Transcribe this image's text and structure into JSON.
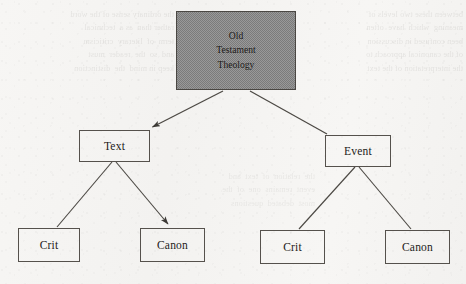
{
  "diagram": {
    "type": "tree",
    "title": "Old Testament Theology",
    "root": {
      "id": "root",
      "lines": [
        "Old",
        "Testament",
        "Theology"
      ],
      "fill": "#8a8a8a",
      "filled": true
    },
    "nodes": [
      {
        "id": "text",
        "label": "Text"
      },
      {
        "id": "event",
        "label": "Event"
      },
      {
        "id": "text-crit",
        "label": "Crit"
      },
      {
        "id": "text-canon",
        "label": "Canon"
      },
      {
        "id": "event-crit",
        "label": "Crit"
      },
      {
        "id": "event-canon",
        "label": "Canon"
      }
    ],
    "edges": [
      {
        "from": "root",
        "to": "text",
        "arrow": true
      },
      {
        "from": "root",
        "to": "event",
        "arrow": false
      },
      {
        "from": "text",
        "to": "text-crit",
        "arrow": false
      },
      {
        "from": "text",
        "to": "text-canon",
        "arrow": true
      },
      {
        "from": "event",
        "to": "event-crit",
        "arrow": false
      },
      {
        "from": "event",
        "to": "event-canon",
        "arrow": false
      }
    ],
    "stroke_color": "#55514c",
    "text_color": "#1d1b19"
  },
  "background": {
    "paper_color": "#f6f5f3",
    "showthrough_left": "the ordinary sense of the word\nrather than  as a  technical\nterm  of  literary  criticism\nand  so  the  reader  must\nkeep in mind  the  distinction",
    "showthrough_right": "between these two levels of\nmeaning  which  have  often\nbeen confused in discussion\nof the canonical approach to\nthe interpretation of the text",
    "showthrough_mid": "the  relation  of  text  and\nevent  remains  one  of  the\nmost  debated  questions"
  }
}
